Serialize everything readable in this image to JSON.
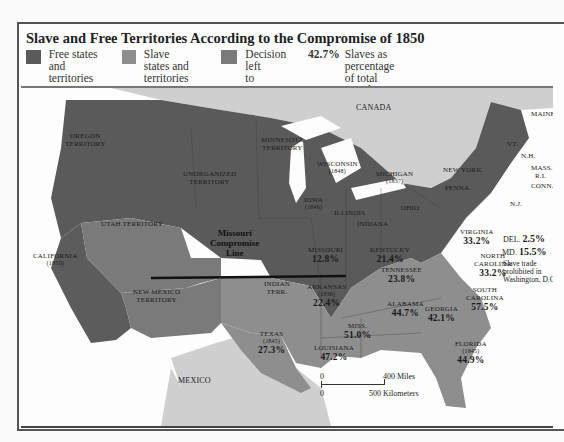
{
  "title": "Slave and Free Territories According to the Compromise of 1850",
  "colors": {
    "free": "#5a5a5a",
    "slave": "#8e8e8e",
    "decision": "#7a7a7a",
    "foreign": "#cfcfcf",
    "water": "#fdfdfd"
  },
  "legend": [
    {
      "swatch": "free",
      "label_line1": "Free states and",
      "label_line2": "territories"
    },
    {
      "swatch": "slave",
      "label_line1": "Slave states and",
      "label_line2": "territories"
    },
    {
      "swatch": "decision",
      "label_line1": "Decision left",
      "label_line2": "to territories"
    },
    {
      "pct": "42.7%",
      "label_line1": "Slaves as percentage",
      "label_line2": "of total population"
    }
  ],
  "regions": {
    "canada": "CANADA",
    "mexico": "MEXICO",
    "oregon": {
      "l1": "OREGON",
      "l2": "TERRITORY"
    },
    "unorganized": {
      "l1": "UNORGANIZED",
      "l2": "TERRITORY"
    },
    "minnesota": {
      "l1": "MINNESOTA",
      "l2": "TERRITORY"
    },
    "utah": "UTAH TERRITORY",
    "new_mexico": {
      "l1": "NEW MEXICO",
      "l2": "TERRITORY"
    },
    "california": {
      "name": "CALIFORNIA",
      "year": "(1850)"
    },
    "wisconsin": {
      "name": "WISCONSIN",
      "year": "(1848)"
    },
    "michigan": {
      "name": "MICHIGAN",
      "year": "(1837)"
    },
    "iowa": {
      "name": "IOWA",
      "year": "(1846)"
    },
    "illinois": "ILLINOIS",
    "indiana": "INDIANA",
    "ohio": "OHIO",
    "penna": "PENNA.",
    "new_york": "NEW YORK",
    "maine": "MAINE",
    "vt": "VT.",
    "nh": "N.H.",
    "mass": "MASS.",
    "ri": "R.I.",
    "conn": "CONN.",
    "nj": "N.J.",
    "del": {
      "name": "DEL.",
      "pct": "2.5%"
    },
    "md": {
      "name": "MD.",
      "pct": "15.5%"
    },
    "dc_note": {
      "l1": "Slave trade",
      "l2": "prohibited in",
      "l3": "Washington, D.C."
    },
    "missouri": {
      "name": "MISSOURI",
      "pct": "12.8%"
    },
    "kentucky": {
      "name": "KENTUCKY",
      "pct": "21.4%"
    },
    "virginia": {
      "name": "VIRGINIA",
      "pct": "33.2%"
    },
    "north_carolina": {
      "l1": "NORTH",
      "l2": "CAROLINA",
      "pct": "33.2%"
    },
    "tennessee": {
      "name": "TENNESSEE",
      "pct": "23.8%"
    },
    "south_carolina": {
      "l1": "SOUTH",
      "l2": "CAROLINA",
      "pct": "57.5%"
    },
    "indian_terr": {
      "l1": "INDIAN",
      "l2": "TERR."
    },
    "arkansas": {
      "name": "ARKANSAS",
      "year": "(1836)",
      "pct": "22.4%"
    },
    "alabama": {
      "name": "ALABAMA",
      "pct": "44.7%"
    },
    "georgia": {
      "name": "GEORGIA",
      "pct": "42.1%"
    },
    "miss": {
      "name": "MISS.",
      "pct": "51.0%"
    },
    "louisiana": {
      "name": "LOUISIANA",
      "pct": "47.2%"
    },
    "texas": {
      "name": "TEXAS",
      "year": "(1845)",
      "pct": "27.3%"
    },
    "florida": {
      "name": "FLORIDA",
      "year": "(1845)",
      "pct": "44.9%"
    }
  },
  "missouri_compromise": {
    "l1": "Missouri",
    "l2": "Compromise",
    "l3": "Line"
  },
  "scale": {
    "zero": "0",
    "miles": "400 Miles",
    "km": "500 Kilometers"
  }
}
